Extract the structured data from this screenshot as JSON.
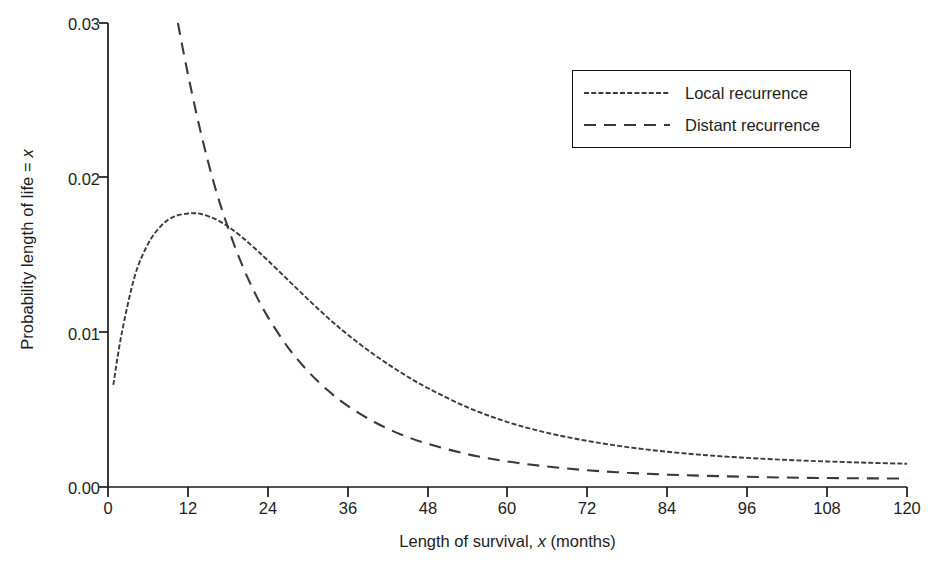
{
  "chart_data": {
    "type": "line",
    "title": "",
    "xlabel": "Length of survival, x (months)",
    "xlabel_parts": {
      "pre": "Length of survival, ",
      "italic": "x",
      "post": " (months)"
    },
    "ylabel": "Probability length of life = x",
    "ylabel_parts": {
      "pre": "Probability length of life = ",
      "italic": "x",
      "post": ""
    },
    "xlim": [
      0,
      120
    ],
    "ylim": [
      0.0,
      0.03
    ],
    "grid": false,
    "legend_position": "top-right",
    "xticks": [
      0,
      12,
      24,
      36,
      48,
      60,
      72,
      84,
      96,
      108,
      120
    ],
    "xtick_labels": [
      "0",
      "12",
      "24",
      "36",
      "48",
      "60",
      "72",
      "84",
      "96",
      "108",
      "120"
    ],
    "yticks": [
      0.0,
      0.01,
      0.02,
      0.03
    ],
    "ytick_labels": [
      "0.00",
      "0.01",
      "0.02",
      "0.03"
    ],
    "series": [
      {
        "name": "Local recurrence",
        "linestyle": "fine-dash",
        "color": "#3a3a3a",
        "x": [
          0.8,
          2,
          4,
          6,
          8,
          10,
          12,
          13,
          14,
          16,
          18,
          20,
          22,
          24,
          27,
          30,
          33,
          36,
          40,
          44,
          48,
          54,
          60,
          66,
          72,
          78,
          84,
          90,
          96,
          102,
          108,
          114,
          120
        ],
        "y": [
          0.0066,
          0.0098,
          0.0136,
          0.0157,
          0.0169,
          0.0175,
          0.01768,
          0.0177,
          0.01765,
          0.01735,
          0.01685,
          0.0162,
          0.01545,
          0.01465,
          0.0134,
          0.01215,
          0.01095,
          0.00985,
          0.00855,
          0.0074,
          0.0064,
          0.00515,
          0.0042,
          0.0035,
          0.00298,
          0.00258,
          0.00228,
          0.00205,
          0.00188,
          0.00175,
          0.00165,
          0.00157,
          0.0015
        ]
      },
      {
        "name": "Distant recurrence",
        "linestyle": "long-dash",
        "color": "#3a3a3a",
        "x": [
          10.5,
          12,
          14,
          16,
          18,
          20,
          22,
          24,
          27,
          30,
          33,
          36,
          40,
          44,
          48,
          54,
          60,
          66,
          72,
          78,
          84,
          90,
          96,
          102,
          108,
          114,
          120
        ],
        "y": [
          0.03,
          0.0267,
          0.0228,
          0.0195,
          0.0168,
          0.0145,
          0.0126,
          0.011,
          0.00905,
          0.0075,
          0.00625,
          0.00525,
          0.0042,
          0.0034,
          0.0028,
          0.00212,
          0.00165,
          0.00132,
          0.00108,
          0.00092,
          0.0008,
          0.00072,
          0.00066,
          0.00061,
          0.00058,
          0.00056,
          0.00055
        ]
      }
    ],
    "annotations": {
      "local_peak": {
        "x": 12.3,
        "y": 0.0177
      },
      "crossing": {
        "x": 18.6,
        "y": 0.0165
      }
    }
  },
  "legend": {
    "items": [
      {
        "label": "Local recurrence",
        "swatch": "fine-dash-swatch"
      },
      {
        "label": "Distant recurrence",
        "swatch": "long-dash-swatch"
      }
    ]
  },
  "caption": {
    "text": ""
  }
}
